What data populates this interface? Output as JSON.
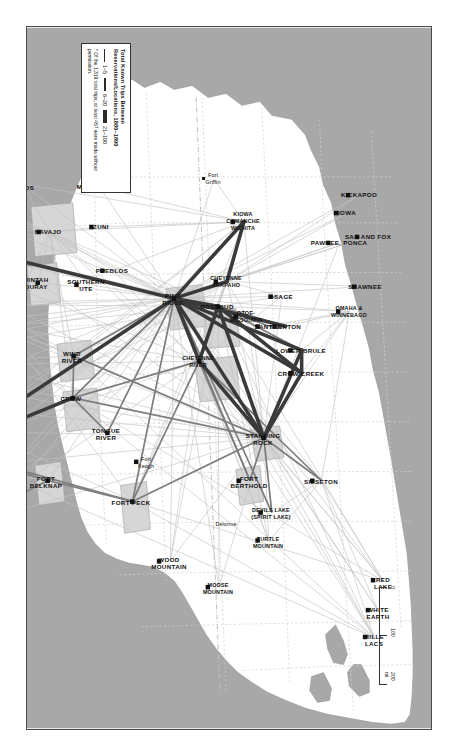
{
  "map": {
    "title": "Total Known Trips Between Reservations/Locations, 1880–1890",
    "orientation_note": "map printed rotated 90 degrees",
    "colors": {
      "ocean": "#a8a8a8",
      "land": "#ffffff",
      "border": "#4a4a4a",
      "line_dark": "#2b2b2b",
      "line_light": "#b9b9b9",
      "node": "#111111",
      "reservation_fill": "#d0d0d0"
    }
  },
  "legend": {
    "title": "Total Known Trips Between\nReservations/Locations, 1880–1890",
    "classes": [
      {
        "label": "1–5",
        "weight": "thin"
      },
      {
        "label": "6–20",
        "weight": "medium"
      },
      {
        "label": "21–100",
        "weight": "thick"
      }
    ],
    "note": "* Of the 1,319 total trips, at least\n457 were made without permission."
  },
  "scale": {
    "ticks": [
      "0",
      "100",
      "200"
    ],
    "unit": "mi"
  },
  "places": [
    {
      "id": "sisseton",
      "label": "SISSETON",
      "x": 455,
      "y": 110
    },
    {
      "id": "mille-lacs",
      "label": "MILLE\nLACS",
      "x": 613,
      "y": 57
    },
    {
      "id": "red-lake",
      "label": "RED\nLAKE",
      "x": 556,
      "y": 48
    },
    {
      "id": "white-earth",
      "label": "WHITE\nEARTH",
      "x": 586,
      "y": 53
    },
    {
      "id": "turtle-mountain",
      "label": "TURTLE\nMOUNTAIN",
      "x": 516,
      "y": 163
    },
    {
      "id": "devils-lake",
      "label": "DEVILS LAKE\n(SPIRIT LAKE)",
      "x": 487,
      "y": 160
    },
    {
      "id": "moose-mountain",
      "label": "MOOSE\nMOUNTAIN",
      "x": 562,
      "y": 213
    },
    {
      "id": "wood-mountain",
      "label": "WOOD\nMOUNTAIN",
      "x": 536,
      "y": 262
    },
    {
      "id": "fort-berthold",
      "label": "FORT\nBERTHOLD",
      "x": 455,
      "y": 182
    },
    {
      "id": "delorme",
      "label": "Delorme",
      "x": 498,
      "y": 205
    },
    {
      "id": "standing-rock",
      "label": "STANDING\nROCK",
      "x": 412,
      "y": 168
    },
    {
      "id": "crow-creek",
      "label": "CROW CREEK",
      "x": 347,
      "y": 130
    },
    {
      "id": "lower-brule",
      "label": "LOWER BRULE",
      "x": 324,
      "y": 130
    },
    {
      "id": "yankton",
      "label": "YANKTON",
      "x": 300,
      "y": 146
    },
    {
      "id": "santee",
      "label": "SANTEE",
      "x": 300,
      "y": 163
    },
    {
      "id": "omaha-winnebago",
      "label": "OMAHA &\nWINNEBAGO",
      "x": 285,
      "y": 82
    },
    {
      "id": "rosebud",
      "label": "ROSEBUD",
      "x": 280,
      "y": 214
    },
    {
      "id": "pine-ridge",
      "label": "PINE\nRIDGE",
      "x": 272,
      "y": 258
    },
    {
      "id": "cheyenne-river",
      "label": "CHEYENNE\nRIVER",
      "x": 335,
      "y": 233
    },
    {
      "id": "fort-peck",
      "label": "FORT PECK",
      "x": 476,
      "y": 300
    },
    {
      "id": "fort-keogh",
      "label": "Fort\nKeogh",
      "x": 436,
      "y": 285
    },
    {
      "id": "tongue-river",
      "label": "TONGUE\nRIVER",
      "x": 407,
      "y": 325
    },
    {
      "id": "crow",
      "label": "CROW",
      "x": 372,
      "y": 360
    },
    {
      "id": "wind-river",
      "label": "WIND\nRIVER",
      "x": 330,
      "y": 359
    },
    {
      "id": "fort-belknap",
      "label": "FORT\nBELKNAP",
      "x": 455,
      "y": 385
    },
    {
      "id": "maple-creek",
      "label": "MAPLE CREEK\n(PLAINS CREE)",
      "x": 478,
      "y": 430
    },
    {
      "id": "fort-macleod",
      "label": "FORT MACLEOD\n(KAINAI)",
      "x": 503,
      "y": 475
    },
    {
      "id": "kainai",
      "label": "KAINAI",
      "x": 442,
      "y": 474
    },
    {
      "id": "blackfeet",
      "label": "BLACKFEET",
      "x": 424,
      "y": 487
    },
    {
      "id": "flathead",
      "label": "FLATHEAD",
      "x": 405,
      "y": 497
    },
    {
      "id": "nez-perce",
      "label": "NEZ\nPERCE",
      "x": 377,
      "y": 520
    },
    {
      "id": "umatilla",
      "label": "UMATILLA",
      "x": 309,
      "y": 563
    },
    {
      "id": "yakama",
      "label": "YAKAMA",
      "x": 341,
      "y": 590
    },
    {
      "id": "warm-springs",
      "label": "WARM\nSPRINGS",
      "x": 289,
      "y": 614
    },
    {
      "id": "western-shoshone",
      "label": "WESTERN\nSHOSHONE",
      "x": 278,
      "y": 498
    },
    {
      "id": "humboldt-wells",
      "label": "Humboldt\nO Wells",
      "x": 270,
      "y": 470
    },
    {
      "id": "paiutes-of-utah",
      "label": "PAIUTES\nOF UTAH",
      "x": 224,
      "y": 480
    },
    {
      "id": "pyramid-lake",
      "label": "PYRAMID\nLAKE",
      "x": 200,
      "y": 585
    },
    {
      "id": "walker-river",
      "label": "WALKER\nRIVER",
      "x": 186,
      "y": 600
    },
    {
      "id": "fort-hall",
      "label": "FORT HALL",
      "x": 300,
      "y": 430
    },
    {
      "id": "uintah-ouray",
      "label": "UINTAH\nOURAY",
      "x": 256,
      "y": 395
    },
    {
      "id": "southern-ute",
      "label": "SOUTHERN\nUTE",
      "x": 258,
      "y": 345
    },
    {
      "id": "navajo",
      "label": "NAVAJO",
      "x": 205,
      "y": 383
    },
    {
      "id": "hopi",
      "label": "HOPI",
      "x": 190,
      "y": 420
    },
    {
      "id": "hualapai",
      "label": "HUALAPAI",
      "x": 185,
      "y": 470
    },
    {
      "id": "san-carlos",
      "label": "SAN\nCARLOS",
      "x": 157,
      "y": 411
    },
    {
      "id": "zuni",
      "label": "ZUNI",
      "x": 200,
      "y": 330
    },
    {
      "id": "pueblos",
      "label": "PUEBLOS",
      "x": 244,
      "y": 319
    },
    {
      "id": "mescalero",
      "label": "MESCALERO",
      "x": 160,
      "y": 333
    },
    {
      "id": "cheyenne-arapaho",
      "label": "CHEYENNE\nARAPAHO",
      "x": 255,
      "y": 205
    },
    {
      "id": "kiowa-comanche-wichita",
      "label": "KIOWA\nCOMANCHE\nWICHITA",
      "x": 195,
      "y": 188
    },
    {
      "id": "fort-griffin",
      "label": "Fort\nGriffin",
      "x": 152,
      "y": 218
    },
    {
      "id": "otoe-missouria",
      "label": "OTOE-\nMISSOURIA",
      "x": 290,
      "y": 185
    },
    {
      "id": "osage",
      "label": "OSAGE",
      "x": 270,
      "y": 150
    },
    {
      "id": "shawnee",
      "label": "SHAWNEE",
      "x": 260,
      "y": 66
    },
    {
      "id": "pawnee-ponca",
      "label": "PAWNEE, PONCA",
      "x": 216,
      "y": 92
    },
    {
      "id": "sac-and-fox",
      "label": "SAC AND FOX",
      "x": 210,
      "y": 63
    },
    {
      "id": "iowa",
      "label": "IOWA",
      "x": 186,
      "y": 84
    },
    {
      "id": "kickapoo",
      "label": "KICKAPOO",
      "x": 168,
      "y": 72
    }
  ]
}
